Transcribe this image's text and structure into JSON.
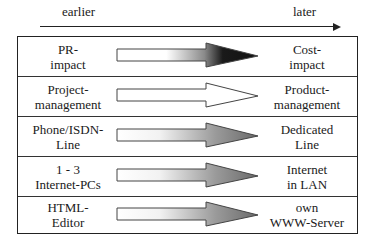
{
  "timeline": {
    "start_label": "earlier",
    "end_label": "later"
  },
  "rows": [
    {
      "left": "PR-\nimpact",
      "right": "Cost-\nimpact",
      "arrow_style": "gradient-dark"
    },
    {
      "left": "Project-\nmanagement",
      "right": "Product-\nmanagement",
      "arrow_style": "hollow"
    },
    {
      "left": "Phone/ISDN-\nLine",
      "right": "Dedicated\nLine",
      "arrow_style": "gradient-gray"
    },
    {
      "left": "1 - 3\nInternet-PCs",
      "right": "Internet\nin LAN",
      "arrow_style": "gradient-gray"
    },
    {
      "left": "HTML-\nEditor",
      "right": "own\nWWW-Server",
      "arrow_style": "gradient-gray"
    }
  ],
  "colors": {
    "line": "#222222",
    "gradient_dark_end": "#111111",
    "gradient_gray_end": "#6e6e6e"
  }
}
